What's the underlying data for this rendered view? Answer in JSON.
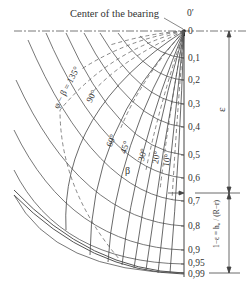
{
  "title": "Center of the bearing",
  "origin_label": "0′",
  "axis": {
    "ticks": [
      {
        "label": "0",
        "y": 31
      },
      {
        "label": "0,1",
        "y": 58
      },
      {
        "label": "0,2",
        "y": 80
      },
      {
        "label": "0,3",
        "y": 104
      },
      {
        "label": "0,4",
        "y": 127
      },
      {
        "label": "0,5",
        "y": 155
      },
      {
        "label": "0,6",
        "y": 178
      },
      {
        "label": "0,7",
        "y": 201
      },
      {
        "label": "0,8",
        "y": 226
      },
      {
        "label": "0,9",
        "y": 250
      },
      {
        "label": "0,95",
        "y": 264
      },
      {
        "label": "0,99",
        "y": 273
      }
    ],
    "epsilon_label": "ε",
    "ratio_label": "1−ε = h₀ / (R−r)"
  },
  "angle_labels": {
    "phi_beta": "φ − β = 135°",
    "deg90": "90°",
    "deg60": "60°",
    "deg45": "45°",
    "deg30": "30°",
    "deg20": "20°",
    "deg10": "10°",
    "beta": "β"
  },
  "colors": {
    "line": "#444444",
    "text": "#333333",
    "background": "#ffffff"
  }
}
